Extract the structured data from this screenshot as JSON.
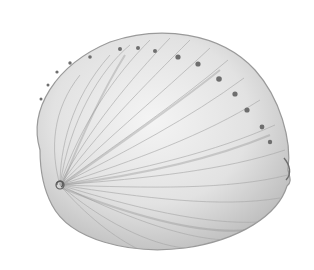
{
  "image": {
    "subject": "abalone shell illustration",
    "style": "pencil sketch, grayscale",
    "background": "#ffffff",
    "ink_color": "#8a8a8a",
    "dark_ink": "#5a5a5a",
    "respiratory_pores_visible": 14
  }
}
